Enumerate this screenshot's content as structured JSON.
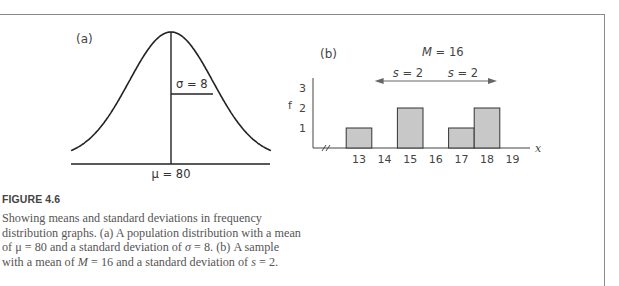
{
  "figure": {
    "title": "FIGURE 4.6",
    "caption_parts": [
      "Showing means and standard deviations in frequency distribution graphs. (a) A population distribution with a mean of μ = 80 and a standard deviation of ",
      "σ",
      " = 8. (b) A sample with a mean of ",
      "M",
      " = 16 and a standard deviation of ",
      "s",
      " = 2."
    ]
  },
  "chart_data": [
    {
      "type": "line",
      "panel_label": "(a)",
      "description": "Normal population distribution curve",
      "mean_label": "μ = 80",
      "sd_label": "σ = 8",
      "mean": 80,
      "sd": 8,
      "grid": false
    },
    {
      "type": "bar",
      "panel_label": "(b)",
      "mean_label": "M = 16",
      "sd_labels": [
        "s = 2",
        "s = 2"
      ],
      "mean": 16,
      "sd": 2,
      "xlabel": "x",
      "ylabel": "f",
      "x_ticks": [
        "13",
        "14",
        "15",
        "16",
        "17",
        "18",
        "19"
      ],
      "y_ticks": [
        "1",
        "2",
        "3"
      ],
      "ylim": [
        0,
        3
      ],
      "categories": [
        13,
        15,
        17,
        18
      ],
      "values": [
        1,
        2,
        1,
        2
      ],
      "bar_color": "#c8c8c8",
      "grid": false
    }
  ]
}
